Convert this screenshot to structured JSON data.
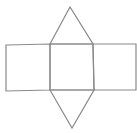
{
  "diagram": {
    "stroke_color": "#8a8a8a",
    "background": "#ffffff",
    "faces": [
      {
        "name": "left-rectangle",
        "points": "6,45 50,44 50,90 6,91"
      },
      {
        "name": "middle-square",
        "points": "50,44 93,44 94,90 50,90"
      },
      {
        "name": "right-rectangle",
        "points": "93,44 136,44 136,90 94,90"
      },
      {
        "name": "top-triangle",
        "points": "50,44 70,7 93,44"
      },
      {
        "name": "bottom-triangle",
        "points": "50,90 72,128 94,90"
      }
    ]
  }
}
